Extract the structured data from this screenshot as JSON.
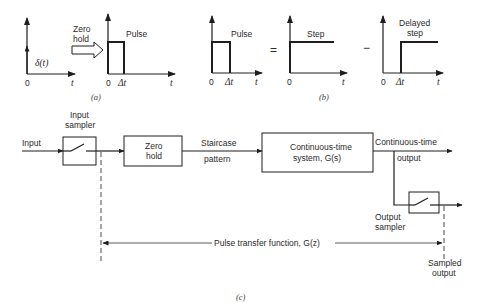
{
  "figure": {
    "panel_a": {
      "caption": "(a)",
      "impulse_label": "δ(t)",
      "impulse_axis": {
        "origin": "0",
        "t": "t"
      },
      "arrow_label_line1": "Zero",
      "arrow_label_line2": "hold",
      "pulse_title": "Pulse",
      "pulse_axis": {
        "origin": "0",
        "delta": "Δt",
        "t": "t"
      }
    },
    "panel_b": {
      "caption": "(b)",
      "pulse_title": "Pulse",
      "pulse_axis": {
        "origin": "0",
        "delta": "Δt",
        "t": "t"
      },
      "equals": "=",
      "step_title": "Step",
      "step_axis": {
        "origin": "0",
        "t": "t"
      },
      "minus": "−",
      "delayed_title_line1": "Delayed",
      "delayed_title_line2": "step",
      "delayed_axis": {
        "origin": "0",
        "delta": "Δt",
        "t": "t"
      }
    },
    "panel_c": {
      "caption": "(c)",
      "input_label": "Input",
      "input_sampler_line1": "Input",
      "input_sampler_line2": "sampler",
      "zero_hold_line1": "Zero",
      "zero_hold_line2": "hold",
      "staircase_line1": "Staircase",
      "staircase_line2": "pattern",
      "system_line1": "Continuous-time",
      "system_line2": "system, G(s)",
      "ct_output_line1": "Continuous-time",
      "ct_output_line2": "output",
      "output_sampler_line1": "Output",
      "output_sampler_line2": "sampler",
      "pulse_tf_label": "Pulse transfer function, G(z)",
      "sampled_output_line1": "Sampled",
      "sampled_output_line2": "output"
    }
  }
}
